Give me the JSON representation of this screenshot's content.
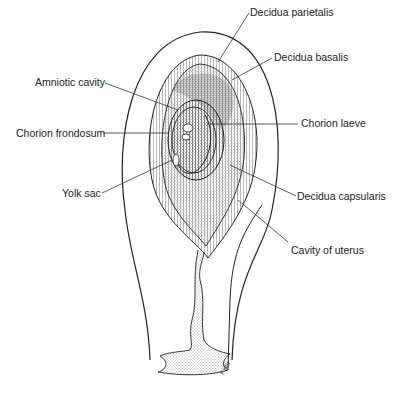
{
  "diagram": {
    "type": "anatomical-illustration",
    "labels": [
      {
        "id": "decidua-parietalis",
        "text": "Decidua parietalis",
        "x": 250,
        "y": 6
      },
      {
        "id": "decidua-basalis",
        "text": "Decidua basalis",
        "x": 274,
        "y": 51
      },
      {
        "id": "amniotic-cavity",
        "text": "Amniotic cavity",
        "x": 35,
        "y": 76
      },
      {
        "id": "chorion-frondosum",
        "text": "Chorion frondosum",
        "x": 16,
        "y": 127
      },
      {
        "id": "chorion-laeve",
        "text": "Chorion laeve",
        "x": 301,
        "y": 117
      },
      {
        "id": "yolk-sac",
        "text": "Yolk sac",
        "x": 62,
        "y": 187
      },
      {
        "id": "decidua-capsularis",
        "text": "Decidua capsularis",
        "x": 297,
        "y": 190
      },
      {
        "id": "cavity-of-uterus",
        "text": "Cavity of uterus",
        "x": 291,
        "y": 244
      }
    ],
    "signature": "F.Hhr",
    "colors": {
      "line": "#222222",
      "background": "#ffffff"
    }
  }
}
